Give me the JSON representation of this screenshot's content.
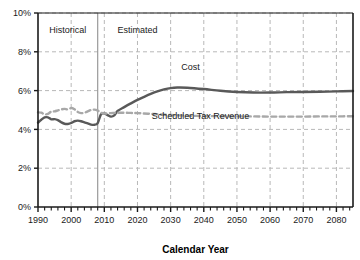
{
  "chart_data": {
    "type": "line",
    "title": "",
    "xlabel": "Calendar Year",
    "ylabel": "",
    "xlim": [
      1990,
      2085
    ],
    "ylim": [
      0,
      10
    ],
    "grid": true,
    "grid_style": "dashed",
    "legend": "inline-annotations",
    "yticks": [
      0,
      2,
      4,
      6,
      8,
      10
    ],
    "ytick_labels": [
      "0%",
      "2%",
      "4%",
      "6%",
      "8%",
      "10%"
    ],
    "xticks": [
      1990,
      2000,
      2010,
      2020,
      2030,
      2040,
      2050,
      2060,
      2070,
      2080
    ],
    "xtick_labels": [
      "1990",
      "2000",
      "2010",
      "2020",
      "2030",
      "2040",
      "2050",
      "2060",
      "2070",
      "2080"
    ],
    "xminor_tick_step": 2,
    "annotations": [
      {
        "text": "Historical",
        "x": 1999,
        "y": 8.95
      },
      {
        "text": "Estimated",
        "x": 2020,
        "y": 8.95
      },
      {
        "text": "Cost",
        "x": 2036,
        "y": 7.05
      },
      {
        "text": "Scheduled Tax Revenue",
        "x": 2039,
        "y": 4.55
      }
    ],
    "divider": {
      "x": 2008,
      "label": "historical-estimated-divider"
    },
    "series": [
      {
        "name": "Cost",
        "style": "solid",
        "color": "#595959",
        "width": 2.4,
        "x": [
          1990,
          1991,
          1992,
          1993,
          1994,
          1995,
          1996,
          1997,
          1998,
          1999,
          2000,
          2001,
          2002,
          2003,
          2004,
          2005,
          2006,
          2007,
          2008,
          2009,
          2010,
          2011,
          2012,
          2013,
          2014,
          2016,
          2018,
          2020,
          2022,
          2024,
          2026,
          2028,
          2030,
          2032,
          2035,
          2040,
          2045,
          2050,
          2055,
          2060,
          2065,
          2070,
          2075,
          2080,
          2085
        ],
        "values": [
          4.35,
          4.5,
          4.62,
          4.62,
          4.52,
          4.53,
          4.48,
          4.37,
          4.29,
          4.28,
          4.33,
          4.42,
          4.45,
          4.42,
          4.36,
          4.31,
          4.25,
          4.24,
          4.32,
          4.78,
          4.82,
          4.74,
          4.66,
          4.72,
          4.95,
          5.15,
          5.34,
          5.52,
          5.68,
          5.83,
          5.96,
          6.06,
          6.13,
          6.16,
          6.15,
          6.08,
          5.99,
          5.93,
          5.9,
          5.9,
          5.92,
          5.93,
          5.94,
          5.96,
          5.98
        ]
      },
      {
        "name": "Scheduled Tax Revenue",
        "style": "dashed",
        "color": "#a8a8a8",
        "width": 2.4,
        "x": [
          1990,
          1991,
          1992,
          1993,
          1994,
          1995,
          1996,
          1997,
          1998,
          1999,
          2000,
          2001,
          2002,
          2003,
          2004,
          2005,
          2006,
          2007,
          2008,
          2009,
          2010,
          2012,
          2014,
          2016,
          2018,
          2020,
          2025,
          2030,
          2035,
          2040,
          2045,
          2050,
          2055,
          2060,
          2065,
          2070,
          2075,
          2080,
          2085
        ],
        "values": [
          4.88,
          4.86,
          4.78,
          4.8,
          4.92,
          4.93,
          4.98,
          5.03,
          5.06,
          5.03,
          5.1,
          5.04,
          4.9,
          4.84,
          4.86,
          4.93,
          5.0,
          5.02,
          4.97,
          4.86,
          4.82,
          4.84,
          4.86,
          4.86,
          4.85,
          4.84,
          4.79,
          4.74,
          4.71,
          4.69,
          4.68,
          4.67,
          4.67,
          4.66,
          4.66,
          4.66,
          4.67,
          4.67,
          4.68
        ]
      }
    ]
  },
  "colors": {
    "cost_line": "#595959",
    "revenue_line": "#a8a8a8",
    "grid": "#b8b8b8",
    "axis": "#1a1a1a",
    "divider": "#9a9a9a",
    "background": "#ffffff"
  }
}
